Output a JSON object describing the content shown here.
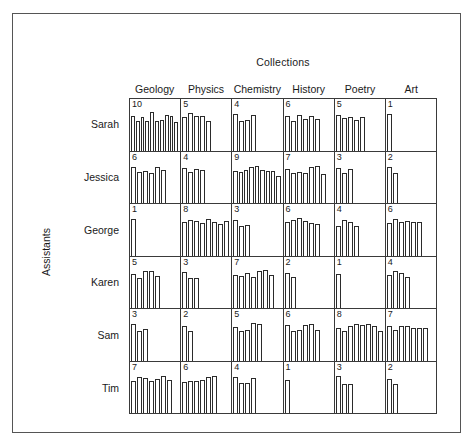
{
  "chart_data": {
    "type": "bar",
    "title": "Collections",
    "xlabel": "Collections",
    "ylabel": "Assistants",
    "layout": "trellis-grid-6x6",
    "grid": true,
    "legend": "none",
    "note": "Each panel shows a histogram; the number in the top-left of each panel is the count of bars in that panel.",
    "categories": [
      "Geology",
      "Physics",
      "Chemistry",
      "History",
      "Poetry",
      "Art"
    ],
    "rows": [
      "Sarah",
      "Jessica",
      "George",
      "Karen",
      "Sam",
      "Tim"
    ],
    "counts": [
      [
        10,
        5,
        4,
        6,
        5,
        1
      ],
      [
        6,
        4,
        9,
        7,
        3,
        2
      ],
      [
        1,
        8,
        3,
        6,
        4,
        6
      ],
      [
        5,
        3,
        7,
        2,
        1,
        4
      ],
      [
        3,
        2,
        5,
        6,
        8,
        7
      ],
      [
        7,
        6,
        4,
        1,
        3,
        2
      ]
    ],
    "panels": [
      {
        "row": "Sarah",
        "cells": [
          {
            "collection": "Geology",
            "count": 10,
            "bar_heights": [
              82,
              72,
              80,
              70,
              92,
              70,
              74,
              86,
              84,
              68
            ]
          },
          {
            "collection": "Physics",
            "count": 5,
            "bar_heights": [
              80,
              90,
              82,
              84,
              70
            ]
          },
          {
            "collection": "Chemistry",
            "count": 4,
            "bar_heights": [
              88,
              72,
              74,
              86
            ]
          },
          {
            "collection": "History",
            "count": 6,
            "bar_heights": [
              82,
              72,
              86,
              76,
              84,
              76
            ]
          },
          {
            "collection": "Poetry",
            "count": 5,
            "bar_heights": [
              86,
              78,
              80,
              74,
              80
            ]
          },
          {
            "collection": "Art",
            "count": 1,
            "bar_heights": [
              88
            ]
          }
        ]
      },
      {
        "row": "Jessica",
        "cells": [
          {
            "collection": "Geology",
            "count": 6,
            "bar_heights": [
              86,
              74,
              76,
              72,
              86,
              80
            ]
          },
          {
            "collection": "Physics",
            "count": 4,
            "bar_heights": [
              84,
              74,
              82,
              80
            ]
          },
          {
            "collection": "Chemistry",
            "count": 9,
            "bar_heights": [
              78,
              74,
              80,
              86,
              88,
              80,
              76,
              78,
              66
            ]
          },
          {
            "collection": "History",
            "count": 7,
            "bar_heights": [
              82,
              72,
              74,
              72,
              86,
              88,
              70
            ]
          },
          {
            "collection": "Poetry",
            "count": 3,
            "bar_heights": [
              84,
              72,
              82
            ]
          },
          {
            "collection": "Art",
            "count": 2,
            "bar_heights": [
              86,
              72
            ]
          }
        ]
      },
      {
        "row": "George",
        "cells": [
          {
            "collection": "Geology",
            "count": 1,
            "bar_heights": [
              88
            ]
          },
          {
            "collection": "Physics",
            "count": 8,
            "bar_heights": [
              80,
              86,
              84,
              78,
              88,
              80,
              76,
              82
            ]
          },
          {
            "collection": "Chemistry",
            "count": 3,
            "bar_heights": [
              86,
              72,
              74
            ]
          },
          {
            "collection": "History",
            "count": 6,
            "bar_heights": [
              80,
              86,
              90,
              84,
              78,
              76
            ]
          },
          {
            "collection": "Poetry",
            "count": 4,
            "bar_heights": [
              72,
              86,
              80,
              70
            ]
          },
          {
            "collection": "Art",
            "count": 6,
            "bar_heights": [
              78,
              88,
              80,
              84,
              80,
              80
            ]
          }
        ]
      },
      {
        "row": "Karen",
        "cells": [
          {
            "collection": "Geology",
            "count": 5,
            "bar_heights": [
              82,
              72,
              90,
              88,
              78
            ]
          },
          {
            "collection": "Physics",
            "count": 3,
            "bar_heights": [
              86,
              72,
              72
            ]
          },
          {
            "collection": "Chemistry",
            "count": 7,
            "bar_heights": [
              80,
              78,
              84,
              74,
              90,
              92,
              80
            ]
          },
          {
            "collection": "History",
            "count": 2,
            "bar_heights": [
              84,
              74
            ]
          },
          {
            "collection": "Poetry",
            "count": 1,
            "bar_heights": [
              82
            ]
          },
          {
            "collection": "Art",
            "count": 4,
            "bar_heights": [
              80,
              90,
              84,
              74
            ]
          }
        ]
      },
      {
        "row": "Sam",
        "cells": [
          {
            "collection": "Geology",
            "count": 3,
            "bar_heights": [
              88,
              72,
              76
            ]
          },
          {
            "collection": "Physics",
            "count": 2,
            "bar_heights": [
              84,
              72
            ]
          },
          {
            "collection": "Chemistry",
            "count": 5,
            "bar_heights": [
              80,
              72,
              74,
              90,
              88
            ]
          },
          {
            "collection": "History",
            "count": 6,
            "bar_heights": [
              86,
              72,
              74,
              86,
              88,
              74
            ]
          },
          {
            "collection": "Poetry",
            "count": 8,
            "bar_heights": [
              78,
              70,
              82,
              88,
              86,
              88,
              84,
              72
            ]
          },
          {
            "collection": "Art",
            "count": 7,
            "bar_heights": [
              84,
              74,
              84,
              82,
              78,
              78,
              78
            ]
          }
        ]
      },
      {
        "row": "Tim",
        "cells": [
          {
            "collection": "Geology",
            "count": 7,
            "bar_heights": [
              76,
              86,
              84,
              78,
              82,
              90,
              80
            ]
          },
          {
            "collection": "Physics",
            "count": 6,
            "bar_heights": [
              74,
              78,
              76,
              80,
              86,
              90
            ]
          },
          {
            "collection": "Chemistry",
            "count": 4,
            "bar_heights": [
              86,
              72,
              72,
              84
            ]
          },
          {
            "collection": "History",
            "count": 1,
            "bar_heights": [
              80
            ]
          },
          {
            "collection": "Poetry",
            "count": 3,
            "bar_heights": [
              88,
              70,
              70
            ]
          },
          {
            "collection": "Art",
            "count": 2,
            "bar_heights": [
              82,
              70
            ]
          }
        ]
      }
    ]
  },
  "colors": {
    "frame": "#555555",
    "grid_line": "#3a3a3a",
    "bar_outline": "#2b2b2b",
    "bar_fill": "#ffffff",
    "background": "#ffffff",
    "text": "#1a1a1a"
  }
}
